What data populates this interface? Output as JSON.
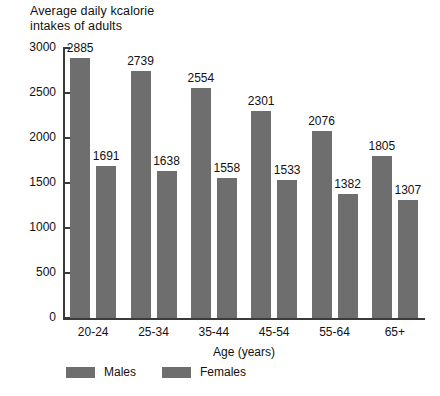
{
  "chart_data": {
    "type": "bar",
    "title": "Average daily kcalorie\nintakes of adults",
    "xlabel": "Age (years)",
    "ylabel": "",
    "categories": [
      "20-24",
      "25-34",
      "35-44",
      "45-54",
      "55-64",
      "65+"
    ],
    "series": [
      {
        "name": "Males",
        "values": [
          2885,
          2739,
          2554,
          2301,
          2076,
          1805
        ],
        "color": "#6e6e6e"
      },
      {
        "name": "Females",
        "values": [
          1691,
          1638,
          1558,
          1533,
          1382,
          1307
        ],
        "color": "#6e6e6e"
      }
    ],
    "ylim": [
      0,
      3000
    ],
    "ytick_labels": [
      "3000",
      "2500",
      "2000",
      "1500",
      "1000",
      "500",
      "0"
    ],
    "ytick_values": [
      3000,
      2500,
      2000,
      1500,
      1000,
      500,
      0
    ],
    "grid": false,
    "legend_position": "bottom-left",
    "data_labels": true,
    "axis_color": "#3a3a3a",
    "background": "#ffffff"
  }
}
